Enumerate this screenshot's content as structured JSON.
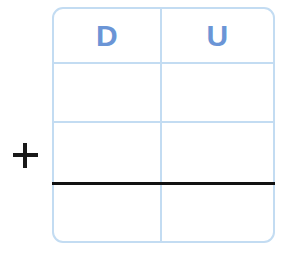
{
  "worksheet": {
    "operator": {
      "symbol": "+",
      "name": "plus-sign",
      "color": "#191919"
    },
    "table": {
      "border_color": "#c3dcf2",
      "background": "#ffffff",
      "columns": [
        {
          "key": "tens",
          "label": "D"
        },
        {
          "key": "units",
          "label": "U"
        }
      ],
      "header_text_color": "#6b95d6",
      "rows": [
        {
          "type": "header",
          "cells": [
            "D",
            "U"
          ]
        },
        {
          "type": "addend",
          "cells": [
            "",
            ""
          ]
        },
        {
          "type": "addend",
          "cells": [
            "",
            ""
          ]
        },
        {
          "type": "sum",
          "cells": [
            "",
            ""
          ]
        }
      ],
      "answer_rule": {
        "name": "answer-rule",
        "color": "#111111"
      }
    }
  }
}
